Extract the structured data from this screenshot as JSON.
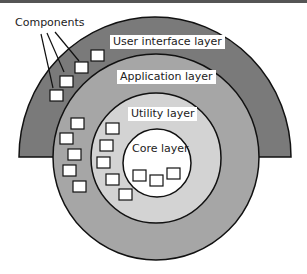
{
  "diagram": {
    "type": "concentric-layers",
    "callout_label": "Components",
    "layers": [
      {
        "name": "User interface layer",
        "fill": "#7a7a7a",
        "shape": "half-ring"
      },
      {
        "name": "Application layer",
        "fill": "#a6a6a6",
        "shape": "circle"
      },
      {
        "name": "Utility layer",
        "fill": "#d3d3d3",
        "shape": "circle"
      },
      {
        "name": "Core layer",
        "fill": "#ffffff",
        "shape": "circle"
      }
    ],
    "component_box_fill": "#ffffff",
    "stroke": "#111111"
  }
}
